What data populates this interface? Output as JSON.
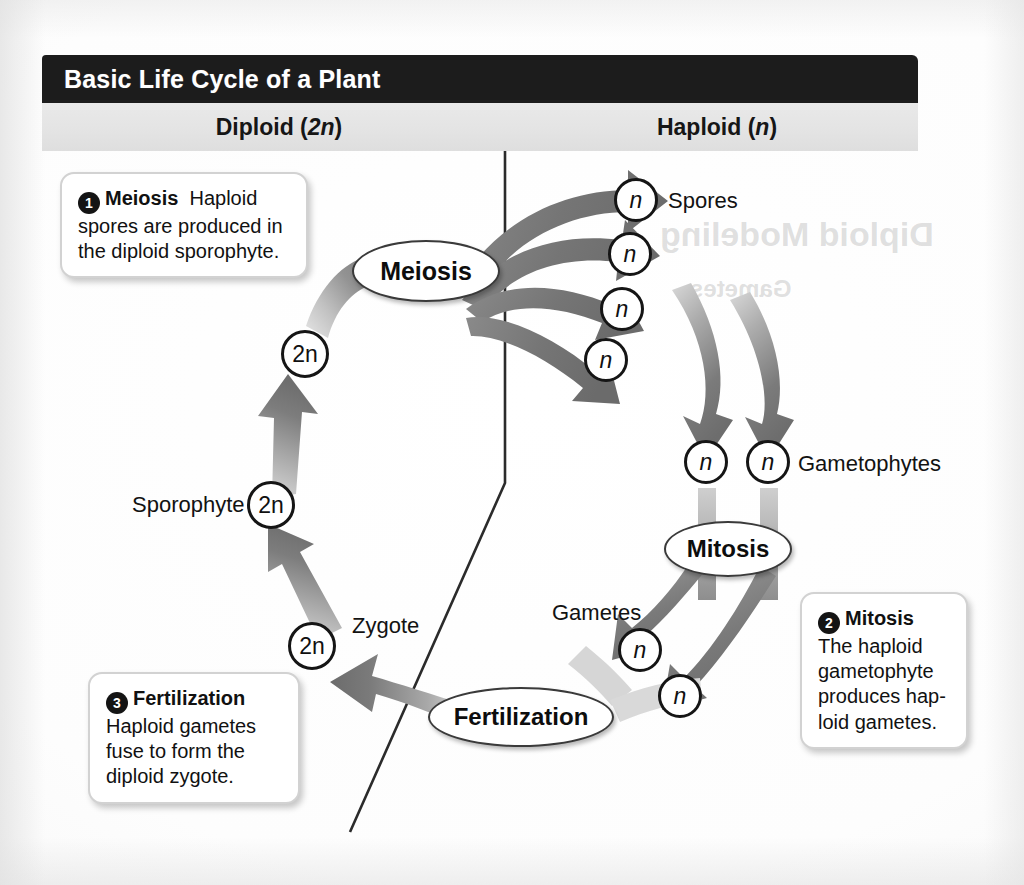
{
  "header": {
    "title": "Basic Life Cycle of a Plant",
    "columns": [
      {
        "name": "diploid",
        "label_text": "Diploid (",
        "label_italic": "2n",
        "label_tail": ")"
      },
      {
        "name": "haploid",
        "label_text": "Haploid (",
        "label_italic": "n",
        "label_tail": ")"
      }
    ]
  },
  "stages": [
    {
      "id": "meiosis",
      "label": "Meiosis"
    },
    {
      "id": "mitosis",
      "label": "Mitosis"
    },
    {
      "id": "fertilization",
      "label": "Fertilization"
    }
  ],
  "labels": {
    "spores": "Spores",
    "gametophytes": "Gametophytes",
    "gametes": "Gametes",
    "sporophyte": "Sporophyte",
    "zygote": "Zygote"
  },
  "tokens": {
    "haploid": "n",
    "diploid": "2n"
  },
  "callouts": [
    {
      "id": "callout-1",
      "number": "1",
      "keyword": "Meiosis",
      "body": "Haploid spores are produced in the diploid sporophyte."
    },
    {
      "id": "callout-2",
      "number": "2",
      "keyword": "Mitosis",
      "body": "The haploid gametophyte produces hap-loid gametes."
    },
    {
      "id": "callout-3",
      "number": "3",
      "keyword": "Fertilization",
      "body": "Haploid gametes fuse to form the diploid zygote."
    }
  ],
  "ghost_text": {
    "top": "Diploid Modeling",
    "mid": "Gametes"
  },
  "colors": {
    "title_bar": "#1c1c1c",
    "subhead_bar": "#e4e4e4",
    "arrow_dark": "#6f6f6f",
    "arrow_light": "#d8d8d8",
    "stroke": "#151515",
    "paper": "#ffffff"
  }
}
